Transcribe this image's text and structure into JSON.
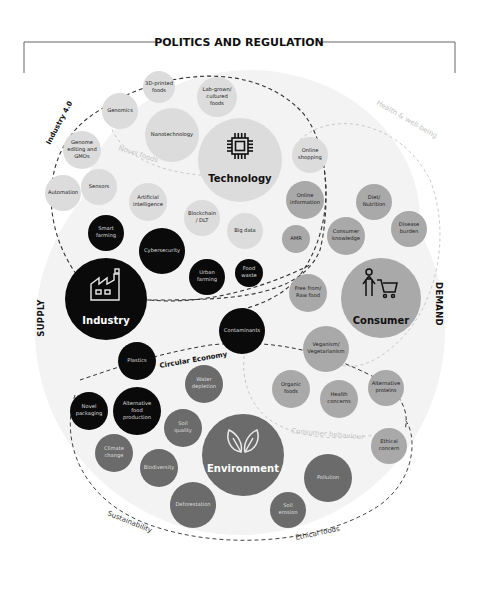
{
  "header": {
    "title": "POLITICS AND REGULATION"
  },
  "axes": {
    "left": "SUPPLY",
    "right": "DEMAND"
  },
  "colors": {
    "background_blob": "#f2f2f2",
    "technology": "#dcdcdc",
    "industry": "#0a0a0a",
    "consumer": "#a9a9a9",
    "environment": "#6b6b6b",
    "dashed_dark": "#333333",
    "dashed_light": "#c8c8c8",
    "text_dark": "#1a1a1a",
    "text_light": "#e8e8e8"
  },
  "groups": {
    "industry_4_0": "Industry 4.0",
    "novel_foods": "Novel foods",
    "health_wellbeing": "Health & well-being",
    "circular_economy": "Circular Economy",
    "consumer_behaviour": "Consumer behaviour",
    "sustainability": "Sustainability",
    "ethical_foods": "Ethical foods"
  },
  "hubs": {
    "technology": {
      "label": "Technology",
      "icon": "chip-icon"
    },
    "industry": {
      "label": "Industry",
      "icon": "factory-icon"
    },
    "consumer": {
      "label": "Consumer",
      "icon": "shopper-cart-icon"
    },
    "environment": {
      "label": "Environment",
      "icon": "leaves-icon"
    }
  },
  "nodes": {
    "technology": [
      {
        "lines": [
          "3D-printed",
          "foods"
        ]
      },
      {
        "lines": [
          "Lab-grown/",
          "cultured",
          "foods"
        ]
      },
      {
        "lines": [
          "Genomics"
        ]
      },
      {
        "lines": [
          "Nanotechnology"
        ]
      },
      {
        "lines": [
          "Genome",
          "editing and",
          "GMOs"
        ]
      },
      {
        "lines": [
          "Automation"
        ]
      },
      {
        "lines": [
          "Sensors"
        ]
      },
      {
        "lines": [
          "Artificial",
          "intelligence"
        ]
      },
      {
        "lines": [
          "Blockchain",
          "/ DLT"
        ]
      },
      {
        "lines": [
          "Big data"
        ]
      },
      {
        "lines": [
          "Online",
          "shopping"
        ]
      }
    ],
    "industry": [
      {
        "lines": [
          "Smart",
          "farming"
        ]
      },
      {
        "lines": [
          "Cybersecurity"
        ]
      },
      {
        "lines": [
          "Urban",
          "farming"
        ]
      },
      {
        "lines": [
          "Food",
          "waste"
        ]
      },
      {
        "lines": [
          "Contaminants"
        ]
      },
      {
        "lines": [
          "Plastics"
        ]
      },
      {
        "lines": [
          "Novel",
          "packaging"
        ]
      },
      {
        "lines": [
          "Alternative",
          "food",
          "production"
        ]
      }
    ],
    "consumer": [
      {
        "lines": [
          "Online",
          "information"
        ]
      },
      {
        "lines": [
          "AMR"
        ]
      },
      {
        "lines": [
          "Diet/",
          "Nutrition"
        ]
      },
      {
        "lines": [
          "Consumer",
          "knowledge"
        ]
      },
      {
        "lines": [
          "Disease",
          "burden"
        ]
      },
      {
        "lines": [
          "Free from/",
          "Raw food"
        ]
      },
      {
        "lines": [
          "Veganism/",
          "Vegetarianism"
        ]
      },
      {
        "lines": [
          "Organic",
          "foods"
        ]
      },
      {
        "lines": [
          "Health",
          "concerns"
        ]
      },
      {
        "lines": [
          "Alternative",
          "proteins"
        ]
      },
      {
        "lines": [
          "Ethical",
          "concern"
        ]
      }
    ],
    "environment": [
      {
        "lines": [
          "Water",
          "depletion"
        ]
      },
      {
        "lines": [
          "Soil",
          "quality"
        ]
      },
      {
        "lines": [
          "Climate",
          "change"
        ]
      },
      {
        "lines": [
          "Biodiversity"
        ]
      },
      {
        "lines": [
          "Deforestation"
        ]
      },
      {
        "lines": [
          "Pollution"
        ]
      },
      {
        "lines": [
          "Soil",
          "erosion"
        ]
      }
    ]
  }
}
